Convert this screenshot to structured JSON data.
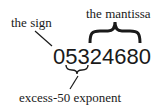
{
  "diagram": {
    "number": "05324680",
    "labels": {
      "sign": "the sign",
      "mantissa": "the mantissa",
      "exponent": "excess-50 exponent"
    },
    "colors": {
      "ink": "#1a1a1a",
      "background": "#ffffff"
    }
  }
}
